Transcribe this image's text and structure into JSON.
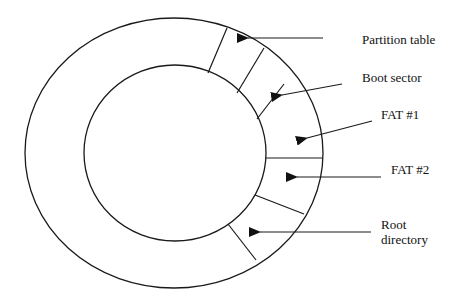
{
  "diagram": {
    "labels": {
      "partition_table": "Partition table",
      "boot_sector": "Boot sector",
      "fat1": "FAT #1",
      "fat2": "FAT #2",
      "root_line1": "Root",
      "root_line2": "directory"
    },
    "colors": {
      "stroke": "#1a1a1a",
      "background": "#ffffff",
      "text": "#111111"
    }
  }
}
